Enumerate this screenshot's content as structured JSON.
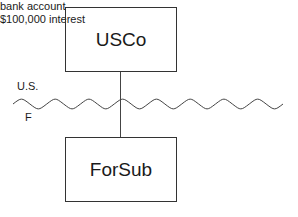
{
  "diagram": {
    "entities": [
      {
        "id": "usco",
        "label": "USCo"
      },
      {
        "id": "forsub",
        "label": "ForSub"
      }
    ],
    "border_labels": {
      "upper": "U.S.",
      "lower": "F"
    },
    "annotation": {
      "line1": "bank account",
      "line2": "$100,000 interest"
    },
    "relationship": {
      "parent": "USCo",
      "child": "ForSub"
    }
  },
  "colors": {
    "line": "#333333",
    "text": "#1a1a1a",
    "background": "#ffffff"
  }
}
